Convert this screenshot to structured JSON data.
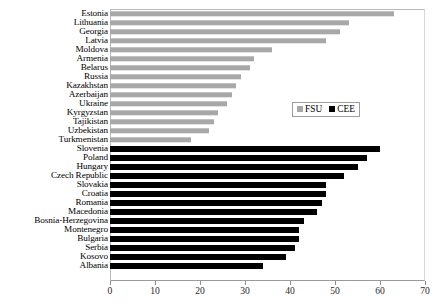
{
  "chart_data": {
    "type": "bar",
    "orientation": "horizontal",
    "title": "",
    "xlabel": "",
    "ylabel": "",
    "xlim": [
      0,
      70
    ],
    "xticks": [
      0,
      10,
      20,
      30,
      40,
      50,
      60,
      70
    ],
    "grid": false,
    "legend": {
      "position": "inside-right",
      "entries": [
        {
          "name": "FSU",
          "color": "#a8a8a8"
        },
        {
          "name": "CEE",
          "color": "#000000"
        }
      ]
    },
    "categories": [
      "Estonia",
      "Lithuania",
      "Georgia",
      "Latvia",
      "Moldova",
      "Armenia",
      "Belarus",
      "Russia",
      "Kazakhstan",
      "Azerbaijan",
      "Ukraine",
      "Kyrgyzstan",
      "Tajikistan",
      "Uzbekistan",
      "Turkmenistan",
      "Slovenia",
      "Poland",
      "Hungary",
      "Czech Republic",
      "Slovakia",
      "Croatia",
      "Romania",
      "Macedonia",
      "Bosnia-Herzegovina",
      "Montenegro",
      "Bulgaria",
      "Serbia",
      "Kosovo",
      "Albania"
    ],
    "series": [
      {
        "name": "FSU",
        "color": "#a8a8a8",
        "points": [
          {
            "category": "Estonia",
            "value": 63
          },
          {
            "category": "Lithuania",
            "value": 53
          },
          {
            "category": "Georgia",
            "value": 51
          },
          {
            "category": "Latvia",
            "value": 48
          },
          {
            "category": "Moldova",
            "value": 36
          },
          {
            "category": "Armenia",
            "value": 32
          },
          {
            "category": "Belarus",
            "value": 31
          },
          {
            "category": "Russia",
            "value": 29
          },
          {
            "category": "Kazakhstan",
            "value": 28
          },
          {
            "category": "Azerbaijan",
            "value": 27
          },
          {
            "category": "Ukraine",
            "value": 26
          },
          {
            "category": "Kyrgyzstan",
            "value": 24
          },
          {
            "category": "Tajikistan",
            "value": 23
          },
          {
            "category": "Uzbekistan",
            "value": 22
          },
          {
            "category": "Turkmenistan",
            "value": 18
          }
        ]
      },
      {
        "name": "CEE",
        "color": "#000000",
        "points": [
          {
            "category": "Slovenia",
            "value": 60
          },
          {
            "category": "Poland",
            "value": 57
          },
          {
            "category": "Hungary",
            "value": 55
          },
          {
            "category": "Czech Republic",
            "value": 52
          },
          {
            "category": "Slovakia",
            "value": 48
          },
          {
            "category": "Croatia",
            "value": 48
          },
          {
            "category": "Romania",
            "value": 47
          },
          {
            "category": "Macedonia",
            "value": 46
          },
          {
            "category": "Bosnia-Herzegovina",
            "value": 43
          },
          {
            "category": "Montenegro",
            "value": 42
          },
          {
            "category": "Bulgaria",
            "value": 42
          },
          {
            "category": "Serbia",
            "value": 41
          },
          {
            "category": "Kosovo",
            "value": 39
          },
          {
            "category": "Albania",
            "value": 34
          }
        ]
      }
    ]
  }
}
